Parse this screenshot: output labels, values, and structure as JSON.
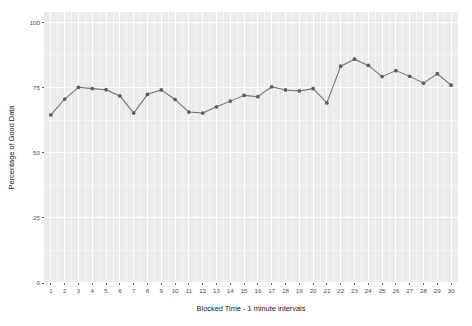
{
  "chart_data": {
    "type": "line",
    "title": "",
    "subtitle": "",
    "xlabel": "Blocked Time - 1 minute intervals",
    "ylabel": "Percentage of Good Data",
    "x": [
      1,
      2,
      3,
      4,
      5,
      6,
      7,
      8,
      9,
      10,
      11,
      12,
      13,
      14,
      15,
      16,
      17,
      18,
      19,
      20,
      21,
      22,
      23,
      24,
      25,
      26,
      27,
      28,
      29,
      30
    ],
    "values": [
      64.5,
      70.6,
      75.1,
      74.6,
      74.2,
      71.8,
      65.2,
      72.4,
      74.1,
      70.4,
      65.6,
      65.2,
      67.6,
      69.8,
      72.0,
      71.5,
      75.3,
      74.1,
      73.7,
      74.6,
      69.1,
      83.2,
      85.9,
      83.5,
      79.2,
      81.5,
      79.3,
      76.7,
      80.3,
      75.9
    ],
    "xtick_labels": [
      "1",
      "2",
      "3",
      "4",
      "5",
      "6",
      "7",
      "8",
      "9",
      "10",
      "11",
      "12",
      "13",
      "14",
      "15",
      "16",
      "17",
      "18",
      "19",
      "20",
      "21",
      "22",
      "23",
      "24",
      "25",
      "26",
      "27",
      "28",
      "29",
      "30"
    ],
    "ytick_labels": [
      "0",
      "25",
      "50",
      "75",
      "100"
    ],
    "ytick_values": [
      0,
      25,
      50,
      75,
      100
    ],
    "ylim": [
      0,
      104
    ],
    "xlim": [
      0.5,
      30.5
    ],
    "grid": true,
    "legend": false,
    "marker": "circle",
    "colors": {
      "panel_background": "#ebebeb",
      "gridline": "#ffffff",
      "line": "#6f6f7a",
      "point": "#5d5d68",
      "tick_text": "#4d4d4d",
      "axis_title": "#1a1a1a",
      "figure_background": "#ffffff"
    }
  }
}
